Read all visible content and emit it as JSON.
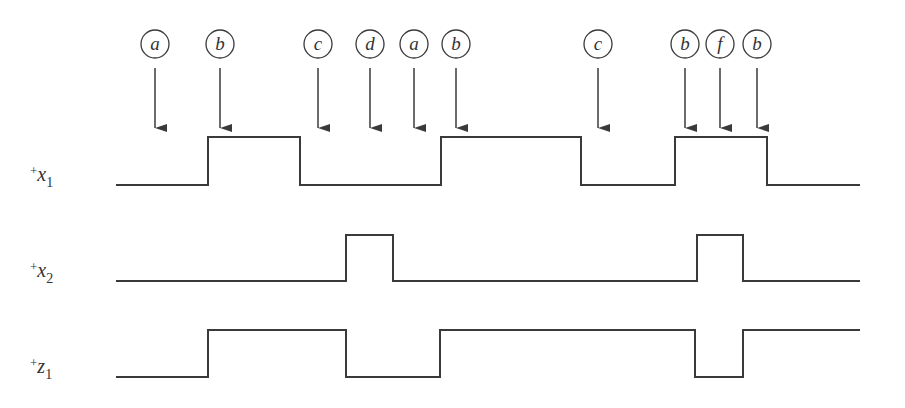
{
  "diagram": {
    "type": "timing-diagram",
    "colors": {
      "line": "#3a3a3a",
      "background": "#ffffff"
    },
    "events": [
      {
        "label": "a",
        "x": 155
      },
      {
        "label": "b",
        "x": 220
      },
      {
        "label": "c",
        "x": 318
      },
      {
        "label": "d",
        "x": 370
      },
      {
        "label": "a",
        "x": 414
      },
      {
        "label": "b",
        "x": 456
      },
      {
        "label": "c",
        "x": 598
      },
      {
        "label": "b",
        "x": 685
      },
      {
        "label": "f",
        "x": 720
      },
      {
        "label": "b",
        "x": 757
      }
    ],
    "signals": [
      {
        "name": "x1",
        "label_plus": "+",
        "label_var": "x",
        "label_sub": "1",
        "label_y": 185,
        "high_y": 137,
        "low_y": 185,
        "start_x": 116,
        "end_x": 860,
        "transitions": [
          208,
          300,
          441,
          581,
          675,
          767
        ],
        "initial": "low"
      },
      {
        "name": "x2",
        "label_plus": "+",
        "label_var": "x",
        "label_sub": "2",
        "label_y": 281,
        "high_y": 235,
        "low_y": 281,
        "start_x": 116,
        "end_x": 860,
        "transitions": [
          346,
          393,
          697,
          743
        ],
        "initial": "low"
      },
      {
        "name": "z1",
        "label_plus": "+",
        "label_var": "z",
        "label_sub": "1",
        "label_y": 377,
        "high_y": 330,
        "low_y": 377,
        "start_x": 116,
        "end_x": 860,
        "transitions": [
          208,
          346,
          440,
          695,
          743
        ],
        "initial": "low"
      }
    ]
  }
}
